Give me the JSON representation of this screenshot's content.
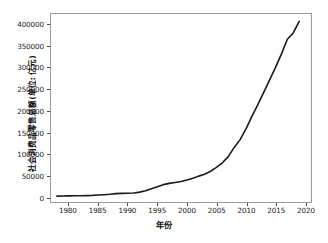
{
  "chart_data": {
    "type": "line",
    "title": "",
    "subtitle": "",
    "xlabel": "年份",
    "ylabel": "社会消费品零售总额(单位: 亿元)",
    "xlim": [
      1977,
      2021
    ],
    "ylim": [
      -12000,
      425000
    ],
    "grid": false,
    "legend": null,
    "line_color": "#1a1a1a",
    "line_width": 1.6,
    "x_ticks": [
      1980,
      1985,
      1990,
      1995,
      2000,
      2005,
      2010,
      2015,
      2020
    ],
    "x_tick_labels": [
      "1980",
      "1985",
      "1990",
      "1995",
      "2000",
      "2005",
      "2010",
      "2015",
      "2020"
    ],
    "y_ticks": [
      0,
      50000,
      100000,
      150000,
      200000,
      250000,
      300000,
      350000,
      400000
    ],
    "y_tick_labels": [
      "0",
      "50000",
      "100000",
      "150000",
      "200000",
      "250000",
      "300000",
      "350000",
      "400000"
    ],
    "series": [
      {
        "name": "社会消费品零售总额",
        "x": [
          1978,
          1979,
          1980,
          1981,
          1982,
          1983,
          1984,
          1985,
          1986,
          1987,
          1988,
          1989,
          1990,
          1991,
          1992,
          1993,
          1994,
          1995,
          1996,
          1997,
          1998,
          1999,
          2000,
          2001,
          2002,
          2003,
          2004,
          2005,
          2006,
          2007,
          2008,
          2009,
          2010,
          2011,
          2012,
          2013,
          2014,
          2015,
          2016,
          2017,
          2018,
          2019
        ],
        "values": [
          1559,
          1800,
          2140,
          2350,
          2570,
          2849,
          3376,
          4305,
          4950,
          5820,
          7440,
          8101,
          8300,
          8990,
          10994,
          14270,
          18623,
          23614,
          28360,
          31253,
          33378,
          35648,
          39106,
          43055,
          48136,
          52516,
          59501,
          68353,
          79145,
          93572,
          114830,
          133048,
          158008,
          187206,
          214433,
          242843,
          271896,
          300931,
          332316,
          366262,
          380987,
          408017
        ],
        "unit": "亿元"
      }
    ]
  }
}
